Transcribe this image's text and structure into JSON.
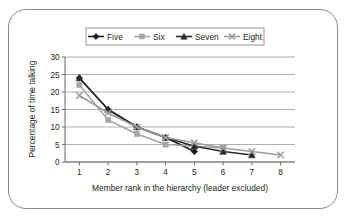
{
  "figure": {
    "border_color": "#8a8a8a",
    "background": "#ffffff"
  },
  "chart_data": {
    "type": "line",
    "title": "",
    "xlabel": "Member rank in the hierarchy (leader excluded)",
    "ylabel": "Percentage of time talking",
    "x": [
      1,
      2,
      3,
      4,
      5,
      6,
      7,
      8
    ],
    "xlim": [
      0.5,
      8.5
    ],
    "ylim": [
      0,
      30
    ],
    "yticks": [
      0,
      5,
      10,
      15,
      20,
      25,
      30
    ],
    "xticks": [
      1,
      2,
      3,
      4,
      5,
      6,
      7,
      8
    ],
    "grid": "horizontal",
    "legend_position": "top",
    "series": [
      {
        "name": "Five",
        "marker": "diamond",
        "color": "#1a1a1a",
        "x": [
          1,
          2,
          3,
          4,
          5
        ],
        "values": [
          24,
          15,
          10,
          7,
          3
        ]
      },
      {
        "name": "Six",
        "marker": "square",
        "color": "#a6a6a6",
        "x": [
          1,
          2,
          3,
          4,
          5,
          6
        ],
        "values": [
          22,
          12,
          8,
          5,
          4.5,
          4
        ]
      },
      {
        "name": "Seven",
        "marker": "triangle",
        "color": "#2b2b2b",
        "x": [
          1,
          2,
          3,
          4,
          5,
          6,
          7
        ],
        "values": [
          24,
          15,
          10,
          7,
          4.5,
          3,
          2
        ]
      },
      {
        "name": "Eight",
        "marker": "x",
        "color": "#9c9c9c",
        "x": [
          1,
          2,
          3,
          4,
          5,
          6,
          7,
          8
        ],
        "values": [
          19,
          14,
          10,
          7,
          5.5,
          4,
          3,
          2
        ]
      }
    ]
  },
  "ytick_labels": [
    "0",
    "5",
    "10",
    "15",
    "20",
    "25",
    "30"
  ],
  "xtick_labels": [
    "1",
    "2",
    "3",
    "4",
    "5",
    "6",
    "7",
    "8"
  ],
  "legend": {
    "items": [
      {
        "label": "Five",
        "icon": "diamond-marker-icon"
      },
      {
        "label": "Six",
        "icon": "square-marker-icon"
      },
      {
        "label": "Seven",
        "icon": "triangle-marker-icon"
      },
      {
        "label": "Eight",
        "icon": "x-marker-icon"
      }
    ]
  }
}
